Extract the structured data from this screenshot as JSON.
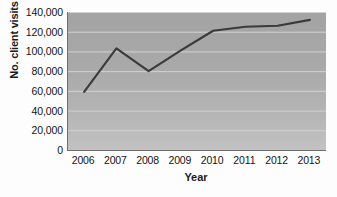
{
  "chart_data": {
    "type": "line",
    "title": "",
    "xlabel": "Year",
    "ylabel": "No. client visits",
    "categories": [
      "2006",
      "2007",
      "2008",
      "2009",
      "2010",
      "2011",
      "2012",
      "2013"
    ],
    "values": [
      59000,
      103000,
      80000,
      101000,
      121000,
      125000,
      126000,
      132000
    ],
    "series": [
      {
        "name": "No. client visits",
        "values": [
          59000,
          103000,
          80000,
          101000,
          121000,
          125000,
          126000,
          132000
        ]
      }
    ],
    "ylim": [
      0,
      140000
    ],
    "ytick_step": 20000,
    "ytick_labels": [
      "0",
      "20,000",
      "40,000",
      "60,000",
      "80,000",
      "100,000",
      "120,000",
      "140,000"
    ],
    "ytick_values": [
      0,
      20000,
      40000,
      60000,
      80000,
      100000,
      120000,
      140000
    ],
    "grid": true,
    "grid_axis": "y",
    "legend": false,
    "legend_position": "none",
    "line_color": "#3a3a3a",
    "plot_background": "#a9a9a9",
    "grid_color": "#d2d2d2",
    "axis_color": "#6f6f6f",
    "text_color": "#141414"
  }
}
